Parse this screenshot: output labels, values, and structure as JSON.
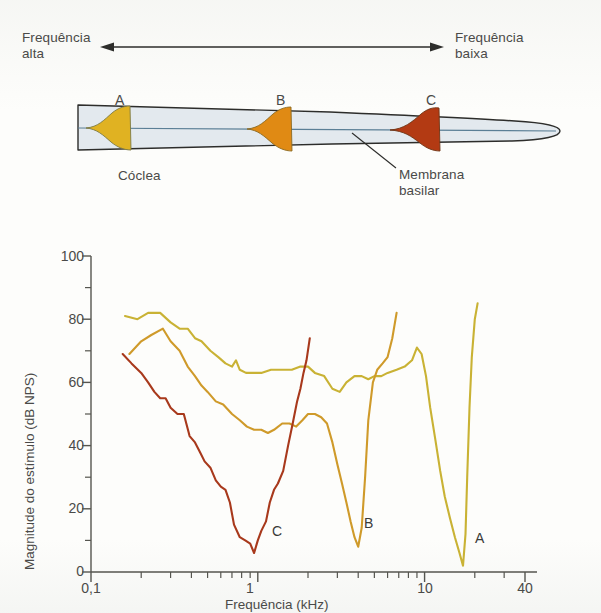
{
  "figure": {
    "diagram": {
      "high_freq_label": "Frequência\nalta",
      "high_freq_line1": "Frequência",
      "high_freq_line2": "alta",
      "low_freq_line1": "Frequência",
      "low_freq_line2": "baixa",
      "cochlea_label": "Cóclea",
      "basilar_line1": "Membrana",
      "basilar_line2": "basilar",
      "site_markers": [
        "A",
        "B",
        "C"
      ],
      "colors": {
        "cochlea_fill": "#e3e9ee",
        "cochlea_outline": "#2d2d2b",
        "basilar_line": "#5b7f96",
        "envelope_a": "#e0b222",
        "envelope_b": "#e08a14",
        "envelope_c": "#b33a13"
      }
    }
  },
  "chart_data": {
    "type": "line",
    "title": "",
    "xlabel": "Frequência (kHz)",
    "ylabel": "Magnitude do estímulo (dB NPS)",
    "xscale": "log",
    "xlim": [
      0.1,
      40
    ],
    "ylim": [
      0,
      100
    ],
    "xticks_labeled": [
      0.1,
      1,
      10,
      40
    ],
    "xtick_labels": [
      "0,1",
      "1",
      "10",
      "40"
    ],
    "xticks_minor": [
      0.2,
      0.3,
      0.4,
      0.5,
      0.6,
      0.7,
      0.8,
      0.9,
      2,
      3,
      4,
      5,
      6,
      7,
      8,
      9,
      20,
      30
    ],
    "yticks_labeled": [
      0,
      20,
      40,
      60,
      80,
      100
    ],
    "ytick_labels": [
      "0",
      "20",
      "40",
      "60",
      "80",
      "100"
    ],
    "yticks_minor": [
      10,
      30,
      50,
      70,
      90
    ],
    "grid": false,
    "legend": "none (curves annotated in place as A, B, C)",
    "annotations": [
      {
        "text": "A",
        "x": 22,
        "y": 6
      },
      {
        "text": "B",
        "x": 4.6,
        "y": 9
      },
      {
        "text": "C",
        "x": 1.25,
        "y": 7
      }
    ],
    "series": [
      {
        "name": "A",
        "color": "#c9b234",
        "characteristic_frequency_khz": 17,
        "threshold_db": 2,
        "points": [
          [
            0.16,
            81
          ],
          [
            0.19,
            80
          ],
          [
            0.22,
            82
          ],
          [
            0.26,
            82
          ],
          [
            0.3,
            79
          ],
          [
            0.34,
            77
          ],
          [
            0.38,
            77
          ],
          [
            0.42,
            74
          ],
          [
            0.46,
            73
          ],
          [
            0.52,
            70
          ],
          [
            0.58,
            68
          ],
          [
            0.64,
            66
          ],
          [
            0.7,
            65
          ],
          [
            0.74,
            67
          ],
          [
            0.78,
            64
          ],
          [
            0.85,
            63
          ],
          [
            0.95,
            63
          ],
          [
            1.05,
            63
          ],
          [
            1.2,
            64
          ],
          [
            1.4,
            64
          ],
          [
            1.6,
            64
          ],
          [
            1.8,
            65
          ],
          [
            2.0,
            65
          ],
          [
            2.2,
            63
          ],
          [
            2.5,
            62
          ],
          [
            2.8,
            58
          ],
          [
            3.1,
            57
          ],
          [
            3.4,
            60
          ],
          [
            3.8,
            62
          ],
          [
            4.2,
            62
          ],
          [
            4.6,
            61
          ],
          [
            5.0,
            62
          ],
          [
            5.5,
            62
          ],
          [
            6.0,
            63
          ],
          [
            6.8,
            64
          ],
          [
            7.6,
            65
          ],
          [
            8.4,
            67
          ],
          [
            9.0,
            71
          ],
          [
            9.6,
            69
          ],
          [
            10.2,
            62
          ],
          [
            10.8,
            52
          ],
          [
            11.6,
            42
          ],
          [
            12.4,
            32
          ],
          [
            13.2,
            24
          ],
          [
            14.2,
            17
          ],
          [
            15.2,
            11
          ],
          [
            16.2,
            6
          ],
          [
            17.0,
            2
          ],
          [
            17.6,
            12
          ],
          [
            18.0,
            30
          ],
          [
            18.6,
            52
          ],
          [
            19.2,
            68
          ],
          [
            20.0,
            80
          ],
          [
            20.8,
            85
          ]
        ]
      },
      {
        "name": "B",
        "color": "#cf9a2a",
        "characteristic_frequency_khz": 4.0,
        "threshold_db": 8,
        "points": [
          [
            0.17,
            69
          ],
          [
            0.2,
            73
          ],
          [
            0.23,
            75
          ],
          [
            0.27,
            77
          ],
          [
            0.3,
            73
          ],
          [
            0.34,
            70
          ],
          [
            0.38,
            65
          ],
          [
            0.42,
            62
          ],
          [
            0.46,
            59
          ],
          [
            0.5,
            57
          ],
          [
            0.56,
            54
          ],
          [
            0.62,
            53
          ],
          [
            0.7,
            50
          ],
          [
            0.78,
            48
          ],
          [
            0.86,
            46
          ],
          [
            0.95,
            45
          ],
          [
            1.05,
            45
          ],
          [
            1.15,
            44
          ],
          [
            1.25,
            45
          ],
          [
            1.4,
            47
          ],
          [
            1.55,
            47
          ],
          [
            1.7,
            46
          ],
          [
            1.85,
            48
          ],
          [
            2.0,
            50
          ],
          [
            2.2,
            50
          ],
          [
            2.4,
            49
          ],
          [
            2.6,
            47
          ],
          [
            2.8,
            41
          ],
          [
            3.0,
            34
          ],
          [
            3.2,
            28
          ],
          [
            3.4,
            22
          ],
          [
            3.6,
            16
          ],
          [
            3.8,
            11
          ],
          [
            4.0,
            8
          ],
          [
            4.2,
            14
          ],
          [
            4.4,
            30
          ],
          [
            4.6,
            48
          ],
          [
            4.9,
            60
          ],
          [
            5.2,
            64
          ],
          [
            5.6,
            66
          ],
          [
            6.0,
            68
          ],
          [
            6.4,
            74
          ],
          [
            6.8,
            82
          ]
        ]
      },
      {
        "name": "C",
        "color": "#a8391c",
        "characteristic_frequency_khz": 0.95,
        "threshold_db": 6,
        "points": [
          [
            0.155,
            69
          ],
          [
            0.175,
            66
          ],
          [
            0.2,
            63
          ],
          [
            0.22,
            60
          ],
          [
            0.24,
            57
          ],
          [
            0.26,
            55
          ],
          [
            0.28,
            55
          ],
          [
            0.3,
            52
          ],
          [
            0.33,
            50
          ],
          [
            0.36,
            50
          ],
          [
            0.39,
            43
          ],
          [
            0.42,
            41
          ],
          [
            0.45,
            38
          ],
          [
            0.48,
            35
          ],
          [
            0.52,
            33
          ],
          [
            0.56,
            29
          ],
          [
            0.6,
            27
          ],
          [
            0.64,
            26
          ],
          [
            0.68,
            22
          ],
          [
            0.72,
            15
          ],
          [
            0.78,
            11
          ],
          [
            0.84,
            10
          ],
          [
            0.9,
            9
          ],
          [
            0.95,
            6
          ],
          [
            1.0,
            10
          ],
          [
            1.05,
            13
          ],
          [
            1.12,
            16
          ],
          [
            1.18,
            22
          ],
          [
            1.25,
            26
          ],
          [
            1.32,
            28
          ],
          [
            1.42,
            32
          ],
          [
            1.52,
            40
          ],
          [
            1.62,
            47
          ],
          [
            1.72,
            54
          ],
          [
            1.8,
            58
          ],
          [
            1.88,
            63
          ],
          [
            1.96,
            67
          ],
          [
            2.05,
            74
          ]
        ]
      }
    ]
  }
}
